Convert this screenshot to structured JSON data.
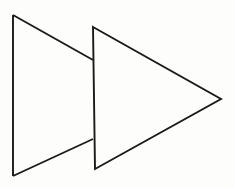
{
  "figure": {
    "title": "Two Overlapping Triangles",
    "canvas": {
      "width": 235,
      "height": 188,
      "background_color": "#fdfdfb"
    },
    "style": {
      "stroke_color": "#1a1a1a",
      "stroke_width": 1.9,
      "fill_color": "#fdfdfb"
    },
    "shapes": [
      {
        "name": "back-triangle",
        "label": "Left triangle (partially occluded)",
        "type": "triangle",
        "orientation": "points-right",
        "occluded": true,
        "visible_path": "M 13 15 L 93 60 M 13 15 L 13 176 M 13 176 L 93 139",
        "vertices_visible": [
          {
            "x": 13,
            "y": 15
          },
          {
            "x": 13,
            "y": 176
          }
        ],
        "clipped_at_x": 93,
        "edge_terminations": [
          {
            "x": 93,
            "y": 60
          },
          {
            "x": 93,
            "y": 139
          }
        ]
      },
      {
        "name": "front-triangle",
        "label": "Right triangle (on top)",
        "type": "triangle",
        "orientation": "points-right",
        "occluded": false,
        "visible_path": "M 93 27 L 221 99 L 95 169 Z",
        "vertices_visible": [
          {
            "x": 93,
            "y": 27
          },
          {
            "x": 221,
            "y": 99
          },
          {
            "x": 95,
            "y": 169
          }
        ]
      }
    ]
  }
}
